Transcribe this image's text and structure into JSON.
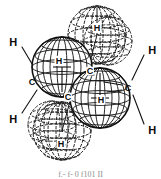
{
  "figure": {
    "type": "molecular-structure-diagram",
    "caption": "f.- f- 0 f101 II",
    "line_color": "#111111",
    "label_color": "#0a0a0a",
    "background": "#ffffff"
  },
  "labels": {
    "outer_hydrogens": [
      {
        "text": "H",
        "x": 13,
        "y": 42
      },
      {
        "text": "H",
        "x": 13,
        "y": 119
      },
      {
        "text": "H",
        "x": 152,
        "y": 50
      },
      {
        "text": "H",
        "x": 152,
        "y": 130
      }
    ],
    "carbons": [
      {
        "text": "C",
        "x": 32,
        "y": 82
      },
      {
        "text": "C",
        "x": 128,
        "y": 88
      },
      {
        "text": "C",
        "x": 90,
        "y": 71
      },
      {
        "text": "C",
        "x": 68,
        "y": 97
      }
    ],
    "sphere_hydrogens": [
      {
        "text": "H",
        "x": 59,
        "y": 61
      },
      {
        "text": "H",
        "x": 101,
        "y": 100
      },
      {
        "text": "H",
        "x": 97,
        "y": 28
      },
      {
        "text": "H",
        "x": 61,
        "y": 144
      }
    ]
  },
  "spheres": [
    {
      "name": "front-upper-left",
      "cx": 62,
      "cy": 67,
      "r": 30,
      "style": "solid"
    },
    {
      "name": "front-lower-right",
      "cx": 100,
      "cy": 98,
      "r": 30,
      "style": "solid"
    },
    {
      "name": "back-upper-right",
      "cx": 97,
      "cy": 35,
      "r": 29,
      "style": "dashed"
    },
    {
      "name": "back-lower-left",
      "cx": 62,
      "cy": 131,
      "r": 29,
      "style": "dashed"
    }
  ],
  "bonds": [
    {
      "name": "bond-h-upper-left-to-c-left",
      "x1": 22,
      "y1": 47,
      "x2": 38,
      "y2": 74
    },
    {
      "name": "bond-h-lower-left-to-c-left",
      "x1": 22,
      "y1": 113,
      "x2": 37,
      "y2": 90
    },
    {
      "name": "bond-h-upper-right-to-c-right",
      "x1": 144,
      "y1": 55,
      "x2": 132,
      "y2": 80
    },
    {
      "name": "bond-h-lower-right-to-c-right",
      "x1": 144,
      "y1": 124,
      "x2": 133,
      "y2": 95
    },
    {
      "name": "bond-c-left-to-c-center-lower",
      "x1": 38,
      "y1": 83,
      "x2": 63,
      "y2": 95
    },
    {
      "name": "bond-c-right-to-c-center-upper",
      "x1": 122,
      "y1": 87,
      "x2": 95,
      "y2": 75
    },
    {
      "name": "bond-c-center-to-c-center",
      "x1": 72,
      "y1": 95,
      "x2": 88,
      "y2": 76
    }
  ]
}
